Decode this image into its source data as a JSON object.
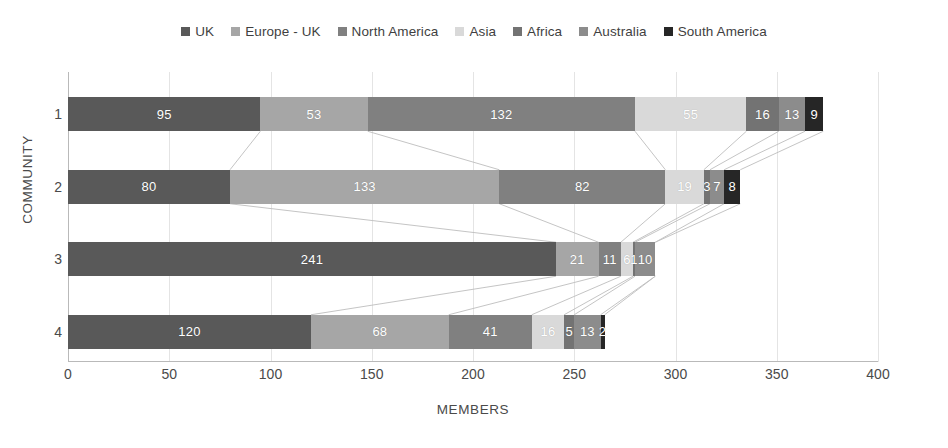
{
  "chart_data": {
    "type": "bar",
    "orientation": "horizontal",
    "stacked": true,
    "title": "",
    "xlabel": "MEMBERS",
    "ylabel": "COMMUNITY",
    "categories": [
      "1",
      "2",
      "3",
      "4"
    ],
    "xlim": [
      0,
      400
    ],
    "xticks": [
      0,
      50,
      100,
      150,
      200,
      250,
      300,
      350,
      400
    ],
    "grid": true,
    "legend_position": "top",
    "series": [
      {
        "name": "UK",
        "color": "#595959",
        "values": [
          95,
          80,
          241,
          120
        ]
      },
      {
        "name": "Europe - UK",
        "color": "#a6a6a6",
        "values": [
          53,
          133,
          21,
          68
        ]
      },
      {
        "name": "North America",
        "color": "#808080",
        "values": [
          132,
          82,
          11,
          41
        ]
      },
      {
        "name": "Asia",
        "color": "#d9d9d9",
        "values": [
          55,
          19,
          6,
          16
        ]
      },
      {
        "name": "Africa",
        "color": "#737373",
        "values": [
          16,
          3,
          1,
          5
        ]
      },
      {
        "name": "Australia",
        "color": "#8c8c8c",
        "values": [
          13,
          7,
          10,
          13
        ]
      },
      {
        "name": "South America",
        "color": "#262626",
        "values": [
          9,
          8,
          0,
          2
        ]
      }
    ],
    "row_totals": [
      373,
      332,
      290,
      265
    ]
  },
  "legend": {
    "items": [
      {
        "label": "UK",
        "color": "#595959"
      },
      {
        "label": "Europe - UK",
        "color": "#a6a6a6"
      },
      {
        "label": "North America",
        "color": "#808080"
      },
      {
        "label": "Asia",
        "color": "#d9d9d9"
      },
      {
        "label": "Africa",
        "color": "#737373"
      },
      {
        "label": "Australia",
        "color": "#8c8c8c"
      },
      {
        "label": "South America",
        "color": "#262626"
      }
    ]
  },
  "axes": {
    "x_title": "MEMBERS",
    "y_title": "COMMUNITY",
    "x_ticks": [
      "0",
      "50",
      "100",
      "150",
      "200",
      "250",
      "300",
      "350",
      "400"
    ],
    "y_ticks": [
      "1",
      "2",
      "3",
      "4"
    ]
  }
}
